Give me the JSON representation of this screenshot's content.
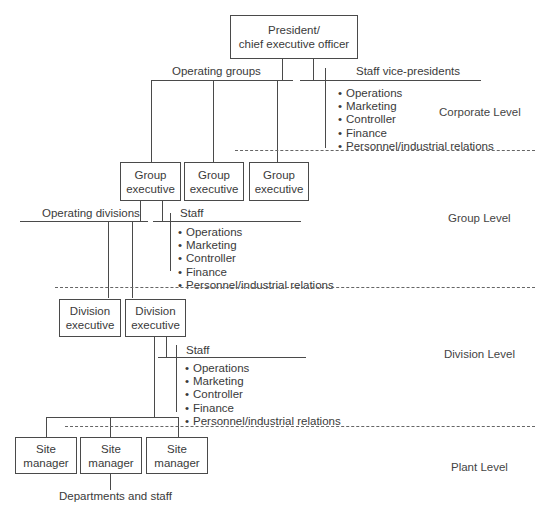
{
  "corporate": {
    "ceo": {
      "line1": "President/",
      "line2": "chief executive officer"
    },
    "operating_label": "Operating groups",
    "staff_label": "Staff vice-presidents",
    "staff_items": [
      "Operations",
      "Marketing",
      "Controller",
      "Finance",
      "Personnel/industrial relations"
    ],
    "level_label": "Corporate Level"
  },
  "group": {
    "boxes": [
      {
        "line1": "Group",
        "line2": "executive"
      },
      {
        "line1": "Group",
        "line2": "executive"
      },
      {
        "line1": "Group",
        "line2": "executive"
      }
    ],
    "operating_label": "Operating divisions",
    "staff_label": "Staff",
    "staff_items": [
      "Operations",
      "Marketing",
      "Controller",
      "Finance",
      "Personnel/industrial relations"
    ],
    "level_label": "Group Level"
  },
  "division": {
    "boxes": [
      {
        "line1": "Division",
        "line2": "executive"
      },
      {
        "line1": "Division",
        "line2": "executive"
      }
    ],
    "staff_label": "Staff",
    "staff_items": [
      "Operations",
      "Marketing",
      "Controller",
      "Finance",
      "Personnel/industrial relations"
    ],
    "level_label": "Division Level"
  },
  "plant": {
    "boxes": [
      {
        "line1": "Site",
        "line2": "manager"
      },
      {
        "line1": "Site",
        "line2": "manager"
      },
      {
        "line1": "Site",
        "line2": "manager"
      }
    ],
    "departments_label": "Departments and staff",
    "level_label": "Plant Level"
  }
}
